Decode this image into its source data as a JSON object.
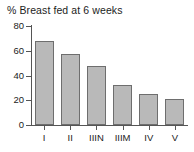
{
  "chart_data": {
    "type": "bar",
    "title": "% Breast fed at 6 weeks",
    "xlabel": "",
    "ylabel": "",
    "categories": [
      "I",
      "II",
      "IIIN",
      "IIIM",
      "IV",
      "V"
    ],
    "values": [
      68,
      57,
      48,
      32,
      25,
      21
    ],
    "ylim": [
      0,
      80
    ],
    "yticks": [
      0,
      20,
      40,
      60,
      80
    ],
    "ytick_labels": [
      "0",
      "20",
      "40",
      "60",
      "80"
    ],
    "grid": false,
    "legend": false,
    "bar_fill_color": "#b9b9b9",
    "bar_border_color": "#6e6e6e",
    "axis_color": "#555555",
    "text_color": "#1c1c1c",
    "background_color": "#ffffff"
  }
}
